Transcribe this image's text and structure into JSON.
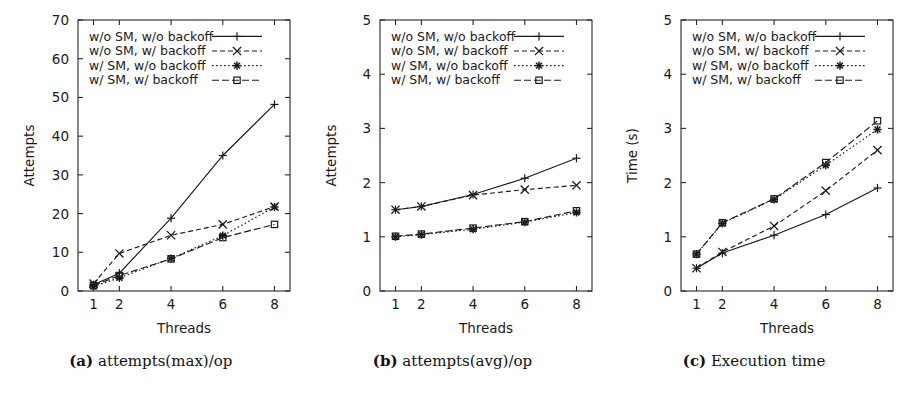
{
  "figure": {
    "panel_count": 3,
    "shared_xlabel": "Threads",
    "shared_xticks": [
      "1",
      "2",
      "4",
      "6",
      "8"
    ]
  },
  "captions": [
    {
      "tag": "(a)",
      "text": " attempts(max)/op"
    },
    {
      "tag": "(b)",
      "text": " attempts(avg)/op"
    },
    {
      "tag": "(c)",
      "text": " Execution time"
    }
  ],
  "legend_entries": [
    {
      "label": "w/o SM, w/o backoff",
      "marker": "plus-marker",
      "dash": "none"
    },
    {
      "label": "w/o SM, w/ backoff",
      "marker": "cross-marker",
      "dash": "dashed"
    },
    {
      "label": "w/ SM, w/o backoff",
      "marker": "asterisk-marker",
      "dash": "dotted"
    },
    {
      "label": "w/ SM, w/ backoff",
      "marker": "square-marker",
      "dash": "dashdot"
    }
  ],
  "chart_data": [
    {
      "type": "line",
      "title": "attempts(max)/op",
      "xlabel": "Threads",
      "ylabel": "Attempts",
      "x": [
        1,
        2,
        4,
        6,
        8
      ],
      "xticks": [
        1,
        2,
        4,
        6,
        8
      ],
      "xlim": [
        0.4,
        8.6
      ],
      "ylim": [
        0,
        70
      ],
      "yticks": [
        0,
        10,
        20,
        30,
        40,
        50,
        60,
        70
      ],
      "grid": false,
      "legend_position": "top-left",
      "series": [
        {
          "name": "w/o SM, w/o backoff",
          "marker": "plus-marker",
          "dash": "none",
          "values": [
            1.6,
            4.6,
            18.8,
            35.0,
            48.2
          ]
        },
        {
          "name": "w/o SM, w/ backoff",
          "marker": "cross-marker",
          "dash": "dashed",
          "values": [
            1.9,
            9.7,
            14.4,
            17.2,
            21.8
          ]
        },
        {
          "name": "w/ SM, w/o backoff",
          "marker": "asterisk-marker",
          "dash": "dotted",
          "values": [
            1.2,
            3.4,
            8.4,
            14.3,
            21.7
          ]
        },
        {
          "name": "w/ SM, w/ backoff",
          "marker": "square-marker",
          "dash": "dashdot",
          "values": [
            1.4,
            4.0,
            8.3,
            13.8,
            17.2
          ]
        }
      ]
    },
    {
      "type": "line",
      "title": "attempts(avg)/op",
      "xlabel": "Threads",
      "ylabel": "Attempts",
      "x": [
        1,
        2,
        4,
        6,
        8
      ],
      "xticks": [
        1,
        2,
        4,
        6,
        8
      ],
      "xlim": [
        0.4,
        8.6
      ],
      "ylim": [
        0,
        5
      ],
      "yticks": [
        0,
        1,
        2,
        3,
        4,
        5
      ],
      "grid": false,
      "legend_position": "top-left",
      "series": [
        {
          "name": "w/o SM, w/o backoff",
          "marker": "plus-marker",
          "dash": "none",
          "values": [
            1.5,
            1.56,
            1.78,
            2.08,
            2.45
          ]
        },
        {
          "name": "w/o SM, w/ backoff",
          "marker": "cross-marker",
          "dash": "dashed",
          "values": [
            1.5,
            1.56,
            1.77,
            1.87,
            1.95
          ]
        },
        {
          "name": "w/ SM, w/o backoff",
          "marker": "asterisk-marker",
          "dash": "dotted",
          "values": [
            1.0,
            1.04,
            1.14,
            1.27,
            1.45
          ]
        },
        {
          "name": "w/ SM, w/ backoff",
          "marker": "square-marker",
          "dash": "dashdot",
          "values": [
            1.01,
            1.05,
            1.16,
            1.28,
            1.48
          ]
        }
      ]
    },
    {
      "type": "line",
      "title": "Execution time",
      "xlabel": "Threads",
      "ylabel": "Time (s)",
      "x": [
        1,
        2,
        4,
        6,
        8
      ],
      "xticks": [
        1,
        2,
        4,
        6,
        8
      ],
      "xlim": [
        0.4,
        8.6
      ],
      "ylim": [
        0,
        5
      ],
      "yticks": [
        0,
        1,
        2,
        3,
        4,
        5
      ],
      "grid": false,
      "legend_position": "top-left",
      "series": [
        {
          "name": "w/o SM, w/o backoff",
          "marker": "plus-marker",
          "dash": "none",
          "values": [
            0.42,
            0.7,
            1.03,
            1.41,
            1.9
          ]
        },
        {
          "name": "w/o SM, w/ backoff",
          "marker": "cross-marker",
          "dash": "dashed",
          "values": [
            0.42,
            0.72,
            1.2,
            1.85,
            2.6
          ]
        },
        {
          "name": "w/ SM, w/o backoff",
          "marker": "asterisk-marker",
          "dash": "dotted",
          "values": [
            0.68,
            1.25,
            1.69,
            2.32,
            2.98
          ]
        },
        {
          "name": "w/ SM, w/ backoff",
          "marker": "square-marker",
          "dash": "dashdot",
          "values": [
            0.68,
            1.26,
            1.7,
            2.37,
            3.14
          ]
        }
      ]
    }
  ]
}
